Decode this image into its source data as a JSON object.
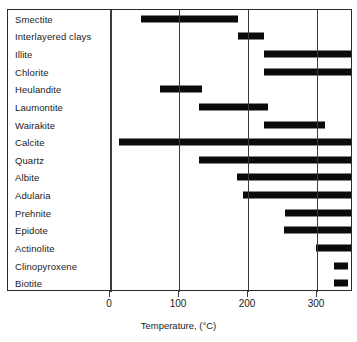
{
  "chart_data": {
    "type": "bar",
    "orientation": "horizontal",
    "title": "",
    "subtitle": "",
    "xlabel": "Temperature, (°C)",
    "ylabel": "",
    "xlim": [
      -18,
      352
    ],
    "xticks": [
      0,
      100,
      200,
      300
    ],
    "xticklabels": [
      "0",
      "100",
      "200",
      "300"
    ],
    "grid": "vertical-only",
    "legend": "none",
    "axis_unit": "°C",
    "categories": [
      "Smectite",
      "Interlayered clays",
      "Illite",
      "Chlorite",
      "Heulandite",
      "Laumontite",
      "Wairakite",
      "Calcite",
      "Quartz",
      "Albite",
      "Adularia",
      "Prehnite",
      "Epidote",
      "Actinolite",
      "Clinopyroxene",
      "Biotite"
    ],
    "bars": [
      {
        "label": "Smectite",
        "start": 45,
        "end": 185,
        "clipped_right": false
      },
      {
        "label": "Interlayered clays",
        "start": 186,
        "end": 223,
        "clipped_right": false
      },
      {
        "label": "Illite",
        "start": 223,
        "end": 352,
        "clipped_right": true
      },
      {
        "label": "Chlorite",
        "start": 223,
        "end": 352,
        "clipped_right": true
      },
      {
        "label": "Heulandite",
        "start": 72,
        "end": 133,
        "clipped_right": false
      },
      {
        "label": "Laumontite",
        "start": 129,
        "end": 229,
        "clipped_right": false
      },
      {
        "label": "Wairakite",
        "start": 223,
        "end": 312,
        "clipped_right": false
      },
      {
        "label": "Calcite",
        "start": 13,
        "end": 352,
        "clipped_right": true
      },
      {
        "label": "Quartz",
        "start": 129,
        "end": 352,
        "clipped_right": true
      },
      {
        "label": "Albite",
        "start": 184,
        "end": 352,
        "clipped_right": true
      },
      {
        "label": "Adularia",
        "start": 193,
        "end": 352,
        "clipped_right": true
      },
      {
        "label": "Prehnite",
        "start": 254,
        "end": 352,
        "clipped_right": true
      },
      {
        "label": "Epidote",
        "start": 252,
        "end": 352,
        "clipped_right": true
      },
      {
        "label": "Actinolite",
        "start": 299,
        "end": 352,
        "clipped_right": true
      },
      {
        "label": "Clinopyroxene",
        "start": 325,
        "end": 345,
        "clipped_right": false
      },
      {
        "label": "Biotite",
        "start": 325,
        "end": 345,
        "clipped_right": false
      }
    ],
    "colors": {
      "bar": "#0b0b0b",
      "frame": "#2a2a2a",
      "gridline": "#3a3a3a",
      "background": "#ffffff",
      "text": "#1b1b1b"
    }
  }
}
